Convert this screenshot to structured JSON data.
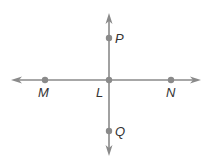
{
  "diagram": {
    "type": "intersecting-lines",
    "colors": {
      "line": "#8a8a8a",
      "point": "#8a8a8a",
      "label": "#333333"
    },
    "lines": [
      {
        "name": "horizontal-line",
        "through": [
          "M",
          "L",
          "N"
        ],
        "arrows": "both"
      },
      {
        "name": "vertical-line",
        "through": [
          "P",
          "L",
          "Q"
        ],
        "arrows": "both"
      }
    ],
    "points": [
      {
        "id": "P",
        "label": "P"
      },
      {
        "id": "M",
        "label": "M"
      },
      {
        "id": "L",
        "label": "L"
      },
      {
        "id": "N",
        "label": "N"
      },
      {
        "id": "Q",
        "label": "Q"
      }
    ]
  }
}
